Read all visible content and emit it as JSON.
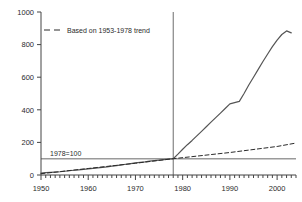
{
  "chart_data": {
    "type": "line",
    "title": "",
    "xlabel": "",
    "ylabel": "",
    "xlim": [
      1950,
      2004
    ],
    "ylim": [
      0,
      1000
    ],
    "grid": false,
    "legend_position": "top-left-inside",
    "yticks": [
      0,
      200,
      400,
      600,
      800,
      1000
    ],
    "ytick_labels": [
      "0",
      "200",
      "400",
      "600",
      "800",
      "1000"
    ],
    "xticks": [
      1950,
      1960,
      1970,
      1980,
      1990,
      2000
    ],
    "xtick_labels": [
      "1950",
      "1960",
      "1970",
      "1980",
      "1990",
      "2000"
    ],
    "minor_xtick_interval": 1,
    "annotations": [
      {
        "name": "baseline-label",
        "text": "1978=100",
        "x": 1957,
        "y": 100
      },
      {
        "name": "reference-line-horizontal",
        "text": "",
        "value": 100
      },
      {
        "name": "reference-line-vertical",
        "text": "",
        "value": 1978
      }
    ],
    "series": [
      {
        "name": "actual",
        "label": "",
        "style": "solid",
        "color": "#555555",
        "x": [
          1950,
          1951,
          1952,
          1953,
          1954,
          1955,
          1956,
          1957,
          1958,
          1959,
          1960,
          1961,
          1962,
          1963,
          1964,
          1965,
          1966,
          1967,
          1968,
          1969,
          1970,
          1971,
          1972,
          1973,
          1974,
          1975,
          1976,
          1977,
          1978,
          1979,
          1980,
          1981,
          1982,
          1983,
          1984,
          1985,
          1986,
          1987,
          1988,
          1989,
          1990,
          1991,
          1992,
          1993,
          1994,
          1995,
          1996,
          1997,
          1998,
          1999,
          2000,
          2001,
          2002,
          2003
        ],
        "values": [
          12,
          14,
          16,
          18,
          20,
          23,
          26,
          29,
          32,
          35,
          38,
          41,
          44,
          47,
          50,
          54,
          58,
          62,
          66,
          70,
          74,
          78,
          81,
          85,
          88,
          91,
          94,
          97,
          100,
          128,
          158,
          186,
          212,
          240,
          268,
          296,
          324,
          352,
          380,
          408,
          436,
          444,
          452,
          500,
          552,
          600,
          648,
          696,
          742,
          788,
          828,
          862,
          884,
          872
        ]
      },
      {
        "name": "trend",
        "label": "Based on 1953-1978 trend",
        "style": "dashed",
        "color": "#2b2b2b",
        "x": [
          1950,
          1960,
          1970,
          1978,
          1990,
          2000,
          2004
        ],
        "values": [
          8,
          40,
          72,
          100,
          138,
          175,
          196
        ]
      }
    ],
    "legend": [
      {
        "label": "Based on 1953-1978 trend",
        "style": "dashed",
        "color": "#2b2b2b"
      }
    ]
  }
}
